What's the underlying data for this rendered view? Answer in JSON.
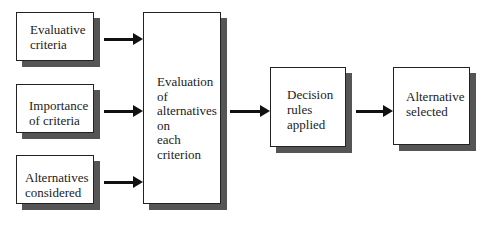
{
  "diagram": {
    "title": "",
    "nodes": [
      {
        "id": "evaluative-criteria",
        "lines": [
          "Evaluative",
          "criteria"
        ]
      },
      {
        "id": "importance-of-criteria",
        "lines": [
          "Importance",
          "of criteria"
        ]
      },
      {
        "id": "alternatives-considered",
        "lines": [
          "Alternatives",
          "considered"
        ]
      },
      {
        "id": "evaluation",
        "lines": [
          "Evaluation",
          "of",
          "alternatives",
          "on",
          "each",
          "criterion"
        ]
      },
      {
        "id": "decision-rules",
        "lines": [
          "Decision",
          "rules",
          "applied"
        ]
      },
      {
        "id": "alternative-selected",
        "lines": [
          "Alternative",
          "selected"
        ]
      }
    ],
    "edges": [
      {
        "from": "evaluative-criteria",
        "to": "evaluation"
      },
      {
        "from": "importance-of-criteria",
        "to": "evaluation"
      },
      {
        "from": "alternatives-considered",
        "to": "evaluation"
      },
      {
        "from": "evaluation",
        "to": "decision-rules"
      },
      {
        "from": "decision-rules",
        "to": "alternative-selected"
      }
    ]
  },
  "labels": {
    "evaluative_criteria": "Evaluative\ncriteria",
    "importance_of_criteria": "Importance\nof criteria",
    "alternatives_considered": "Alternatives\nconsidered",
    "evaluation": "Evaluation\nof\nalternatives\non\neach\ncriterion",
    "decision_rules": "Decision\nrules\napplied",
    "alternative_selected": "Alternative\nselected"
  },
  "colors": {
    "border": "#222222",
    "shadow": "#555555",
    "arrow": "#111111"
  }
}
